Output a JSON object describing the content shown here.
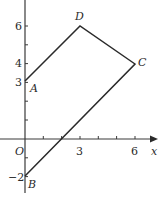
{
  "diagram": {
    "type": "coordinate-plane-quadrilateral",
    "axes": {
      "x_label": "x",
      "origin_label": "O",
      "x_ticks": [
        {
          "value": 3,
          "label": "3"
        },
        {
          "value": 6,
          "label": "6"
        }
      ],
      "y_ticks": [
        {
          "value": 6,
          "label": "6"
        },
        {
          "value": 4,
          "label": "4"
        },
        {
          "value": 3,
          "label": "3"
        },
        {
          "value": -2,
          "label": "−2"
        }
      ]
    },
    "points": [
      {
        "name": "A",
        "x": 0,
        "y": 3
      },
      {
        "name": "B",
        "x": 0,
        "y": -2
      },
      {
        "name": "C",
        "x": 6,
        "y": 4
      },
      {
        "name": "D",
        "x": 3,
        "y": 6
      }
    ],
    "polygon_order": [
      "A",
      "D",
      "C",
      "B"
    ],
    "colors": {
      "line": "#2a2a2a",
      "axis": "#3a3a3a"
    }
  }
}
